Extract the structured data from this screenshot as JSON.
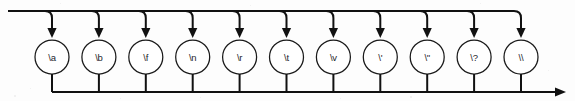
{
  "diagram": {
    "type": "railroad-diagram",
    "canvas": {
      "width": 575,
      "height": 101,
      "background": "#fdfdfd"
    },
    "style": {
      "line_color": "#111111",
      "node_stroke": "#1a1a1a",
      "node_fill": "#ffffff",
      "label_color": "#26262b"
    },
    "geometry": {
      "top_rail_y": 11,
      "top_rail_start_x": 8,
      "bottom_rail_y": 92,
      "bottom_rail_end_x": 566,
      "node_center_y": 57,
      "node_radius": 17,
      "first_node_cx": 52,
      "node_spacing": 46.9,
      "branch_corner_radius": 7,
      "arrow_tip_y": 38,
      "stem_top_y": 74
    },
    "nodes": [
      {
        "id": "esc-alert",
        "label": "\\a"
      },
      {
        "id": "esc-backspace",
        "label": "\\b"
      },
      {
        "id": "esc-formfeed",
        "label": "\\f"
      },
      {
        "id": "esc-newline",
        "label": "\\n"
      },
      {
        "id": "esc-carriage-return",
        "label": "\\r"
      },
      {
        "id": "esc-tab",
        "label": "\\t"
      },
      {
        "id": "esc-vertical-tab",
        "label": "\\v"
      },
      {
        "id": "esc-single-quote",
        "label": "\\'"
      },
      {
        "id": "esc-double-quote",
        "label": "\\\""
      },
      {
        "id": "esc-question-mark",
        "label": "\\?"
      },
      {
        "id": "esc-backslash",
        "label": "\\\\"
      }
    ]
  }
}
